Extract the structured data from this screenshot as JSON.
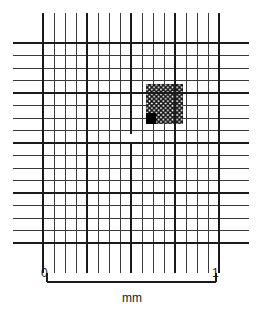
{
  "scale_bar": {
    "left_label": "0",
    "right_label": "1",
    "units_label": "mm",
    "x_start": 47,
    "x_end": 216,
    "y": 282,
    "tick_height": 9
  },
  "chart_data": {
    "type": "diagram",
    "xlabel": "mm",
    "ylabel": "",
    "grid": {
      "bold_square": {
        "x0": 43,
        "y0": 43,
        "x1": 219,
        "y1": 243
      },
      "bold_divisions": 4,
      "bold_line_width": 2.2,
      "fine_line_width": 1.0,
      "fine_divisions_per_bold": 4,
      "fine_overhang_vertical": 30,
      "fine_overhang_horizontal": 30,
      "line_color": "#1a1a1a",
      "fine_line_color": "#3a3a3a",
      "background": "#ffffff"
    },
    "highlights": [
      {
        "name": "hatched-square",
        "style": "cross-hatch",
        "x0": 146,
        "y0": 84,
        "x1": 183,
        "y1": 124,
        "meaning": "one medium square of the grid"
      },
      {
        "name": "solid-black-square",
        "style": "solid-fill",
        "x0": 146,
        "y0": 113,
        "x1": 156,
        "y1": 124,
        "meaning": "one smallest square of the grid"
      },
      {
        "name": "center-blank-cell",
        "style": "blank",
        "x0": 126,
        "y0": 133,
        "x1": 136,
        "y1": 143,
        "meaning": "central unruled cell"
      }
    ],
    "axis_ranges": {
      "x": [
        0,
        1
      ],
      "y": [
        0,
        1
      ]
    },
    "legend": []
  }
}
